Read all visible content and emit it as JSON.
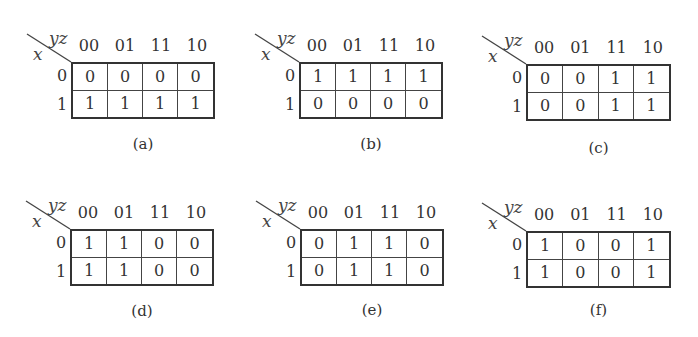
{
  "col_variable": "yz",
  "row_variable": "x",
  "col_headers": [
    "00",
    "01",
    "11",
    "10"
  ],
  "row_headers": [
    "0",
    "1"
  ],
  "maps": [
    {
      "label": "(a)",
      "cells": [
        [
          "0",
          "0",
          "0",
          "0"
        ],
        [
          "1",
          "1",
          "1",
          "1"
        ]
      ]
    },
    {
      "label": "(b)",
      "cells": [
        [
          "1",
          "1",
          "1",
          "1"
        ],
        [
          "0",
          "0",
          "0",
          "0"
        ]
      ]
    },
    {
      "label": "(c)",
      "cells": [
        [
          "0",
          "0",
          "1",
          "1"
        ],
        [
          "0",
          "0",
          "1",
          "1"
        ]
      ]
    },
    {
      "label": "(d)",
      "cells": [
        [
          "1",
          "1",
          "0",
          "0"
        ],
        [
          "1",
          "1",
          "0",
          "0"
        ]
      ]
    },
    {
      "label": "(e)",
      "cells": [
        [
          "0",
          "1",
          "1",
          "0"
        ],
        [
          "0",
          "1",
          "1",
          "0"
        ]
      ]
    },
    {
      "label": "(f)",
      "cells": [
        [
          "1",
          "0",
          "0",
          "1"
        ],
        [
          "1",
          "0",
          "0",
          "1"
        ]
      ]
    }
  ]
}
